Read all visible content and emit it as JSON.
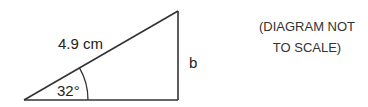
{
  "diagram": {
    "type": "right-triangle",
    "hypotenuse_label": "4.9 cm",
    "angle_label": "32°",
    "opposite_side_label": "b",
    "note_line1": "(DIAGRAM NOT",
    "note_line2": "TO SCALE)",
    "colors": {
      "stroke": "#333333",
      "text": "#222222"
    }
  }
}
